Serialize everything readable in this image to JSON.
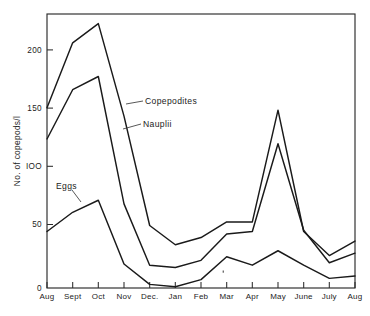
{
  "chart_data": {
    "type": "line",
    "title": "",
    "subtitle": "",
    "xlabel": "",
    "ylabel": "No. of copepods/l",
    "categories": [
      "Aug",
      "Sept",
      "Oct",
      "Nov",
      "Dec.",
      "Jan",
      "Feb",
      "Mar",
      "Apr",
      "May",
      "June",
      "July",
      "Aug"
    ],
    "x": [
      0,
      1,
      2,
      3,
      4,
      5,
      6,
      7,
      8,
      9,
      10,
      11,
      12
    ],
    "xlim": [
      0,
      12
    ],
    "ylim": [
      0,
      228
    ],
    "yticks": [
      0,
      50,
      100,
      150,
      200
    ],
    "ytick_labels": [
      "0",
      "50",
      "IOO",
      "150",
      "200"
    ],
    "grid": false,
    "legend_position": "inline-annotations",
    "series": [
      {
        "name": "Copepodites",
        "values": [
          150,
          204,
          220,
          143,
          52,
          36,
          42,
          55,
          55,
          148,
          47,
          27,
          39
        ]
      },
      {
        "name": "Nauplii",
        "values": [
          124,
          165,
          176,
          70,
          19,
          17,
          23,
          45,
          47,
          120,
          48,
          21,
          29
        ]
      },
      {
        "name": "Eggs",
        "values": [
          47,
          63,
          73,
          20,
          3,
          1,
          7,
          26,
          19,
          31,
          19,
          8,
          10
        ]
      }
    ],
    "annotations": [
      {
        "text": "Copepodites",
        "target_series": "Copepodites"
      },
      {
        "text": "Nauplii",
        "target_series": "Nauplii"
      },
      {
        "text": "Eggs",
        "target_series": "Eggs"
      }
    ]
  },
  "axes": {
    "y_label": "No. of copepods/l",
    "y_tick_labels": [
      "200",
      "150",
      "IOO",
      "50",
      "0"
    ],
    "x_tick_labels": [
      "Aug",
      "Sept",
      "Oct",
      "Nov",
      "Dec.",
      "Jan",
      "Feb",
      "Mar",
      "Apr",
      "May",
      "June",
      "July",
      "Aug"
    ]
  },
  "labels": {
    "copepodites": "Copepodites",
    "nauplii": "Nauplii",
    "eggs": "Eggs"
  }
}
